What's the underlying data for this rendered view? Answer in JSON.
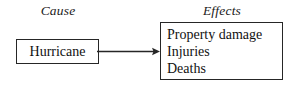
{
  "diagram": {
    "type": "cause-and-effect",
    "width": 296,
    "height": 86,
    "background_color": "#ffffff",
    "line_color": "#262626",
    "text_color": "#111111"
  },
  "headings": {
    "cause": "Cause",
    "effects": "Effects"
  },
  "cause_node": {
    "label": "Hurricane"
  },
  "effects_node": {
    "items": [
      "Property damage",
      "Injuries",
      "Deaths"
    ]
  },
  "connector": {
    "icon": "arrow-right-icon",
    "direction": "right"
  }
}
